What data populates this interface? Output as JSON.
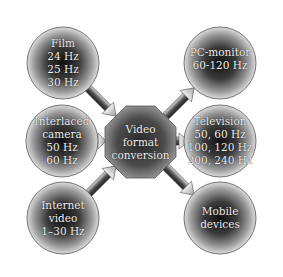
{
  "diagram": {
    "title": "Video format conversion",
    "center": {
      "label_lines": [
        "Video",
        "format",
        "conversion"
      ]
    },
    "inputs": [
      {
        "name": "film",
        "label_lines": [
          "Film",
          "24 Hz",
          "25 Hz",
          "30 Hz"
        ]
      },
      {
        "name": "interlaced-camera",
        "label_lines": [
          "Interlaced",
          "camera",
          "50 Hz",
          "60 Hz"
        ]
      },
      {
        "name": "internet-video",
        "label_lines": [
          "Internet",
          "video",
          "1–30 Hz"
        ]
      }
    ],
    "outputs": [
      {
        "name": "pc-monitor",
        "label_lines": [
          "PC-monitor",
          "60-120 Hz"
        ]
      },
      {
        "name": "television",
        "label_lines": [
          "Television",
          "50, 60 Hz",
          "100, 120 Hz",
          "200, 240 Hz"
        ]
      },
      {
        "name": "mobile-devices",
        "label_lines": [
          "Mobile",
          "devices"
        ]
      }
    ],
    "colors": {
      "node_center": "#1a1a1a",
      "node_edge": "#d8d8d8",
      "outline": "#555555",
      "text": "#f2f2f2",
      "background": "#ffffff"
    }
  }
}
